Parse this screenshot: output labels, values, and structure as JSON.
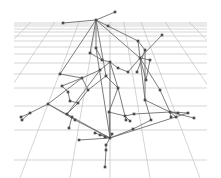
{
  "diagram": {
    "kind": "3d-network-graph-over-perspective-grid",
    "colors": {
      "background": "#ffffff",
      "grid": "#b9b9b9",
      "edge": "#6e6e6e",
      "node": "#4a4a4a"
    },
    "grid": {
      "horizon_y": 22,
      "left_x": 14,
      "right_x": 207,
      "bottom_y": 178,
      "horizontal_rows_y": [
        22,
        24,
        26,
        29,
        32,
        36,
        41,
        47,
        54,
        63,
        74,
        88,
        106,
        130,
        160
      ],
      "vanishing_point": [
        110,
        -60
      ],
      "ray_bottom_x": [
        -260,
        -190,
        -120,
        -50,
        20,
        70,
        110,
        150,
        200,
        270,
        340,
        410,
        480
      ]
    },
    "nodes": [
      {
        "id": "n0",
        "x": 115,
        "y": 12
      },
      {
        "id": "n1",
        "x": 96,
        "y": 20
      },
      {
        "id": "n2",
        "x": 63,
        "y": 23
      },
      {
        "id": "n3",
        "x": 108,
        "y": 26
      },
      {
        "id": "n4",
        "x": 162,
        "y": 35
      },
      {
        "id": "n5",
        "x": 138,
        "y": 41
      },
      {
        "id": "n6",
        "x": 96,
        "y": 48
      },
      {
        "id": "n7",
        "x": 90,
        "y": 53
      },
      {
        "id": "n8",
        "x": 145,
        "y": 50
      },
      {
        "id": "n9",
        "x": 140,
        "y": 58
      },
      {
        "id": "n10",
        "x": 150,
        "y": 60
      },
      {
        "id": "n11",
        "x": 102,
        "y": 60
      },
      {
        "id": "n12",
        "x": 110,
        "y": 62
      },
      {
        "id": "n13",
        "x": 118,
        "y": 68
      },
      {
        "id": "n14",
        "x": 100,
        "y": 70
      },
      {
        "id": "n15",
        "x": 60,
        "y": 74
      },
      {
        "id": "n16",
        "x": 82,
        "y": 78
      },
      {
        "id": "n17",
        "x": 128,
        "y": 72
      },
      {
        "id": "n18",
        "x": 137,
        "y": 72
      },
      {
        "id": "n19",
        "x": 106,
        "y": 76
      },
      {
        "id": "n20",
        "x": 146,
        "y": 80
      },
      {
        "id": "n21",
        "x": 62,
        "y": 86
      },
      {
        "id": "n22",
        "x": 68,
        "y": 92
      },
      {
        "id": "n23",
        "x": 88,
        "y": 90
      },
      {
        "id": "n24",
        "x": 118,
        "y": 88
      },
      {
        "id": "n25",
        "x": 70,
        "y": 101
      },
      {
        "id": "n26",
        "x": 78,
        "y": 103
      },
      {
        "id": "n27",
        "x": 145,
        "y": 100
      },
      {
        "id": "n28",
        "x": 160,
        "y": 90
      },
      {
        "id": "n29",
        "x": 48,
        "y": 104
      },
      {
        "id": "n30",
        "x": 30,
        "y": 113
      },
      {
        "id": "n31",
        "x": 21,
        "y": 117
      },
      {
        "id": "n32",
        "x": 22,
        "y": 120
      },
      {
        "id": "n33",
        "x": 67,
        "y": 114
      },
      {
        "id": "n34",
        "x": 72,
        "y": 117
      },
      {
        "id": "n35",
        "x": 109,
        "y": 112
      },
      {
        "id": "n36",
        "x": 125,
        "y": 116
      },
      {
        "id": "n37",
        "x": 134,
        "y": 114
      },
      {
        "id": "n38",
        "x": 170,
        "y": 112
      },
      {
        "id": "n39",
        "x": 178,
        "y": 113
      },
      {
        "id": "n40",
        "x": 188,
        "y": 113
      },
      {
        "id": "n41",
        "x": 194,
        "y": 118
      },
      {
        "id": "n42",
        "x": 171,
        "y": 117
      },
      {
        "id": "n43",
        "x": 176,
        "y": 117
      },
      {
        "id": "n44",
        "x": 126,
        "y": 120
      },
      {
        "id": "n45",
        "x": 130,
        "y": 121
      },
      {
        "id": "n46",
        "x": 151,
        "y": 120
      },
      {
        "id": "n47",
        "x": 69,
        "y": 128
      },
      {
        "id": "n48",
        "x": 75,
        "y": 120
      },
      {
        "id": "n49",
        "x": 133,
        "y": 129
      },
      {
        "id": "n50",
        "x": 95,
        "y": 133
      },
      {
        "id": "n51",
        "x": 105,
        "y": 137
      },
      {
        "id": "n52",
        "x": 110,
        "y": 138
      },
      {
        "id": "n53",
        "x": 100,
        "y": 135
      },
      {
        "id": "n54",
        "x": 112,
        "y": 134
      },
      {
        "id": "n55",
        "x": 79,
        "y": 140
      },
      {
        "id": "n56",
        "x": 106,
        "y": 145
      },
      {
        "id": "n57",
        "x": 106,
        "y": 150
      },
      {
        "id": "n58",
        "x": 105,
        "y": 167
      }
    ],
    "edges": [
      [
        "n0",
        "n1"
      ],
      [
        "n1",
        "n2"
      ],
      [
        "n1",
        "n3"
      ],
      [
        "n1",
        "n6"
      ],
      [
        "n1",
        "n7"
      ],
      [
        "n1",
        "n15"
      ],
      [
        "n1",
        "n9"
      ],
      [
        "n1",
        "n19"
      ],
      [
        "n3",
        "n5"
      ],
      [
        "n5",
        "n9"
      ],
      [
        "n5",
        "n8"
      ],
      [
        "n4",
        "n9"
      ],
      [
        "n9",
        "n10"
      ],
      [
        "n9",
        "n17"
      ],
      [
        "n9",
        "n28"
      ],
      [
        "n9",
        "n20"
      ],
      [
        "n9",
        "n27"
      ],
      [
        "n8",
        "n18"
      ],
      [
        "n6",
        "n11"
      ],
      [
        "n7",
        "n11"
      ],
      [
        "n11",
        "n12"
      ],
      [
        "n12",
        "n13"
      ],
      [
        "n12",
        "n14"
      ],
      [
        "n12",
        "n24"
      ],
      [
        "n13",
        "n17"
      ],
      [
        "n14",
        "n16"
      ],
      [
        "n15",
        "n16"
      ],
      [
        "n16",
        "n21"
      ],
      [
        "n16",
        "n23"
      ],
      [
        "n16",
        "n29"
      ],
      [
        "n19",
        "n24"
      ],
      [
        "n19",
        "n23"
      ],
      [
        "n21",
        "n22"
      ],
      [
        "n22",
        "n25"
      ],
      [
        "n25",
        "n26"
      ],
      [
        "n23",
        "n26"
      ],
      [
        "n26",
        "n33"
      ],
      [
        "n29",
        "n30"
      ],
      [
        "n30",
        "n31"
      ],
      [
        "n30",
        "n32"
      ],
      [
        "n29",
        "n48"
      ],
      [
        "n29",
        "n52"
      ],
      [
        "n33",
        "n34"
      ],
      [
        "n34",
        "n47"
      ],
      [
        "n48",
        "n52"
      ],
      [
        "n24",
        "n35"
      ],
      [
        "n24",
        "n36"
      ],
      [
        "n35",
        "n36"
      ],
      [
        "n36",
        "n37"
      ],
      [
        "n37",
        "n38"
      ],
      [
        "n27",
        "n38"
      ],
      [
        "n28",
        "n38"
      ],
      [
        "n38",
        "n39"
      ],
      [
        "n38",
        "n40"
      ],
      [
        "n38",
        "n41"
      ],
      [
        "n38",
        "n42"
      ],
      [
        "n38",
        "n43"
      ],
      [
        "n27",
        "n46"
      ],
      [
        "n46",
        "n49"
      ],
      [
        "n36",
        "n44"
      ],
      [
        "n36",
        "n45"
      ],
      [
        "n35",
        "n52"
      ],
      [
        "n49",
        "n52"
      ],
      [
        "n40",
        "n52"
      ],
      [
        "n52",
        "n50"
      ],
      [
        "n52",
        "n51"
      ],
      [
        "n52",
        "n53"
      ],
      [
        "n52",
        "n54"
      ],
      [
        "n52",
        "n55"
      ],
      [
        "n52",
        "n56"
      ],
      [
        "n56",
        "n57"
      ],
      [
        "n57",
        "n58"
      ],
      [
        "n6",
        "n52"
      ],
      [
        "n12",
        "n52"
      ],
      [
        "n14",
        "n33"
      ],
      [
        "n8",
        "n27"
      ],
      [
        "n10",
        "n20"
      ]
    ]
  }
}
